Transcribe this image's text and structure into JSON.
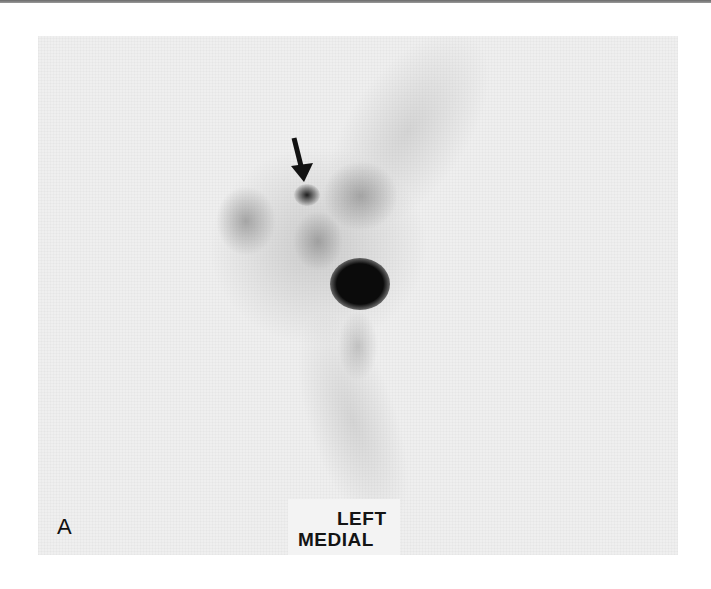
{
  "figure": {
    "panel_letter": "A",
    "view_label": {
      "line1": "LEFT",
      "line2": "MEDIAL"
    },
    "annotation": {
      "type": "arrow",
      "icon": "arrow-down-icon",
      "color": "#111111"
    },
    "colors": {
      "background": "#efefef",
      "hot_spot": "#0b0b0b",
      "page": "#ffffff"
    }
  }
}
